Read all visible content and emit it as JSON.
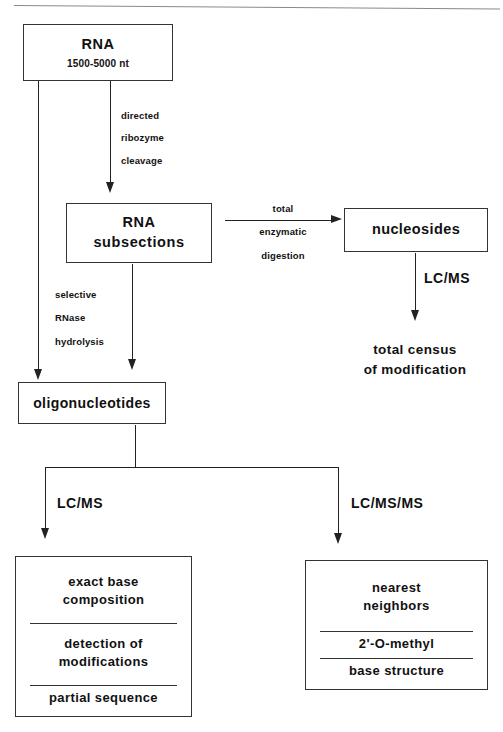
{
  "figure": {
    "line_color": "#222222",
    "box_border_color": "#333333",
    "background": "#ffffff",
    "rule_color": "#8a8a8a"
  },
  "nodes": {
    "rna": {
      "title": "RNA",
      "subtitle": "1500-5000  nt"
    },
    "rna_subsections": {
      "line1": "RNA",
      "line2": "subsections"
    },
    "nucleosides": {
      "label": "nucleosides"
    },
    "oligonucleotides": {
      "label": "oligonucleotides"
    },
    "total_census": {
      "line1": "total  census",
      "line2": "of  modification"
    },
    "lcms_results": {
      "segments": [
        {
          "line1": "exact  base",
          "line2": "composition"
        },
        {
          "line1": "detection  of",
          "line2": "modifications"
        },
        {
          "line1": "partial  sequence",
          "line2": ""
        }
      ]
    },
    "lcmsms_results": {
      "segments": [
        {
          "line1": "nearest",
          "line2": "neighbors"
        },
        {
          "line1": "2'-O-methyl",
          "line2": ""
        },
        {
          "line1": "base  structure",
          "line2": ""
        }
      ]
    }
  },
  "edge_labels": {
    "directed_ribozyme_cleavage": {
      "line1": "directed",
      "line2": "ribozyme",
      "line3": "cleavage"
    },
    "total_enzymatic_digestion": {
      "line1": "total",
      "line2": "enzymatic",
      "line3": "digestion"
    },
    "selective_rnase_hydrolysis": {
      "line1": "selective",
      "line2": "RNase",
      "line3": "hydrolysis"
    },
    "lcms_nucleosides": "LC/MS",
    "lcms_left_branch": "LC/MS",
    "lcmsms_right_branch": "LC/MS/MS"
  }
}
